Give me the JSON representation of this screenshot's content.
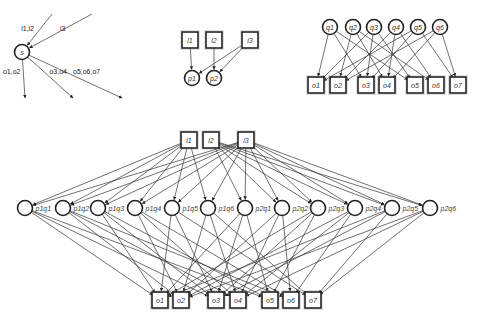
{
  "diagram": {
    "panel_a": {
      "center": {
        "id": "s",
        "label": "s",
        "x": 22,
        "y": 52
      },
      "in_edges": [
        {
          "label": "i1,i2",
          "from": [
            52,
            14
          ]
        },
        {
          "label": "i3",
          "from": [
            92,
            14
          ]
        }
      ],
      "out_edges": [
        {
          "label": "o1,o2",
          "to": [
            25,
            98
          ]
        },
        {
          "label": "o3,o4",
          "to": [
            73,
            98
          ]
        },
        {
          "label": "o5,o6,o7",
          "to": [
            122,
            98
          ]
        }
      ]
    },
    "panel_b": {
      "inputs": [
        {
          "id": "i1",
          "label": "i1",
          "x": 190,
          "y": 40
        },
        {
          "id": "i2",
          "label": "i2",
          "x": 214,
          "y": 40
        },
        {
          "id": "i3",
          "label": "i3",
          "x": 250,
          "y": 40
        }
      ],
      "processes": [
        {
          "id": "p1",
          "label": "p1",
          "x": 192,
          "y": 78
        },
        {
          "id": "p2",
          "label": "p2",
          "x": 214,
          "y": 78
        }
      ],
      "edges": [
        [
          "i1",
          "p1"
        ],
        [
          "i2",
          "p2"
        ],
        [
          "i3",
          "p1"
        ],
        [
          "i3",
          "p2"
        ]
      ]
    },
    "panel_c": {
      "states": [
        {
          "id": "q1",
          "label": "q1",
          "x": 330,
          "y": 27
        },
        {
          "id": "q2",
          "label": "q2",
          "x": 353,
          "y": 27
        },
        {
          "id": "q3",
          "label": "q3",
          "x": 374,
          "y": 27
        },
        {
          "id": "q4",
          "label": "q4",
          "x": 396,
          "y": 27
        },
        {
          "id": "q5",
          "label": "q5",
          "x": 418,
          "y": 27
        },
        {
          "id": "q6",
          "label": "q6",
          "x": 440,
          "y": 27
        }
      ],
      "outputs": [
        {
          "id": "o1",
          "label": "o1",
          "x": 316,
          "y": 85
        },
        {
          "id": "o2",
          "label": "o2",
          "x": 338,
          "y": 85
        },
        {
          "id": "o3",
          "label": "o3",
          "x": 366,
          "y": 85
        },
        {
          "id": "o4",
          "label": "o4",
          "x": 387,
          "y": 85
        },
        {
          "id": "o5",
          "label": "o5",
          "x": 415,
          "y": 85
        },
        {
          "id": "o6",
          "label": "o6",
          "x": 436,
          "y": 85
        },
        {
          "id": "o7",
          "label": "o7",
          "x": 458,
          "y": 85
        }
      ],
      "edges": [
        [
          "q1",
          "o1"
        ],
        [
          "q1",
          "o3"
        ],
        [
          "q1",
          "o5"
        ],
        [
          "q2",
          "o2"
        ],
        [
          "q2",
          "o4"
        ],
        [
          "q2",
          "o6"
        ],
        [
          "q3",
          "o1"
        ],
        [
          "q3",
          "o3"
        ],
        [
          "q3",
          "o5"
        ],
        [
          "q4",
          "o2"
        ],
        [
          "q4",
          "o4"
        ],
        [
          "q4",
          "o6"
        ],
        [
          "q5",
          "o1"
        ],
        [
          "q5",
          "o3"
        ],
        [
          "q5",
          "o7"
        ],
        [
          "q6",
          "o2"
        ],
        [
          "q6",
          "o4"
        ],
        [
          "q6",
          "o7"
        ]
      ]
    },
    "panel_d": {
      "inputs": [
        {
          "id": "i1",
          "label": "i1",
          "x": 189,
          "y": 140
        },
        {
          "id": "i2",
          "label": "i2",
          "x": 211,
          "y": 140
        },
        {
          "id": "i3",
          "label": "i3",
          "x": 246,
          "y": 140
        }
      ],
      "products": [
        {
          "id": "p1q1",
          "label": "p1q1",
          "x": 25,
          "y": 208
        },
        {
          "id": "p1q2",
          "label": "p1q2",
          "x": 63,
          "y": 208
        },
        {
          "id": "p1q3",
          "label": "p1q3",
          "x": 98,
          "y": 208
        },
        {
          "id": "p1q4",
          "label": "p1q4",
          "x": 135,
          "y": 208
        },
        {
          "id": "p1q5",
          "label": "p1q5",
          "x": 172,
          "y": 208
        },
        {
          "id": "p1q6",
          "label": "p1q6",
          "x": 208,
          "y": 208
        },
        {
          "id": "p2q1",
          "label": "p2q1",
          "x": 245,
          "y": 208
        },
        {
          "id": "p2q2",
          "label": "p2q2",
          "x": 282,
          "y": 208
        },
        {
          "id": "p2q3",
          "label": "p2q3",
          "x": 318,
          "y": 208
        },
        {
          "id": "p2q4",
          "label": "p2q4",
          "x": 355,
          "y": 208
        },
        {
          "id": "p2q5",
          "label": "p2q5",
          "x": 392,
          "y": 208
        },
        {
          "id": "p2q6",
          "label": "p2q6",
          "x": 430,
          "y": 208
        }
      ],
      "outputs": [
        {
          "id": "o1",
          "label": "o1",
          "x": 160,
          "y": 300
        },
        {
          "id": "o2",
          "label": "o2",
          "x": 181,
          "y": 300
        },
        {
          "id": "o3",
          "label": "o3",
          "x": 216,
          "y": 300
        },
        {
          "id": "o4",
          "label": "o4",
          "x": 238,
          "y": 300
        },
        {
          "id": "o5",
          "label": "o5",
          "x": 270,
          "y": 300
        },
        {
          "id": "o6",
          "label": "o6",
          "x": 291,
          "y": 300
        },
        {
          "id": "o7",
          "label": "o7",
          "x": 313,
          "y": 300
        }
      ]
    }
  }
}
